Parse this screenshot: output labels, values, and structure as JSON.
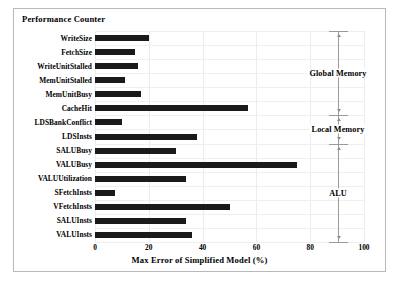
{
  "figure": {
    "header": "Performance Counter",
    "xlabel": "Max Error of Simplified Model  (%)"
  },
  "groups": [
    {
      "label": "Global Memory",
      "from_row": 0,
      "to_row": 5
    },
    {
      "label": "Local Memory",
      "from_row": 6,
      "to_row": 7
    },
    {
      "label": "ALU",
      "from_row": 8,
      "to_row": 14
    }
  ],
  "chart_data": {
    "type": "bar",
    "orientation": "horizontal",
    "title": "",
    "xlabel": "Max Error of Simplified Model  (%)",
    "ylabel": "Performance Counter",
    "xlim": [
      0,
      100
    ],
    "xticks": [
      0,
      20,
      40,
      60,
      80,
      100
    ],
    "grid": true,
    "legend": "none",
    "bar_color": "#1a1a1a",
    "categories": [
      "WriteSize",
      "FetchSize",
      "WriteUnitStalled",
      "MemUnitStalled",
      "MemUnitBusy",
      "CacheHit",
      "LDSBankConflict",
      "LDSInsts",
      "SALUBusy",
      "VALUBusy",
      "VALUUtilization",
      "SFetchInsts",
      "VFetchInsts",
      "SALUInsts",
      "VALUInsts"
    ],
    "values": [
      20,
      15,
      16,
      11,
      17,
      57,
      10,
      38,
      30,
      75,
      34,
      7.5,
      50,
      34,
      36
    ],
    "annotations": [
      "Global Memory",
      "Local Memory",
      "ALU"
    ]
  }
}
